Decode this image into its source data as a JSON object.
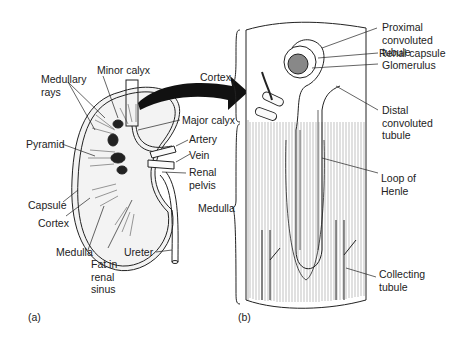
{
  "figure": {
    "panel_a": {
      "tag": "(a)",
      "title": "Kidney longitudinal section",
      "labels": {
        "medullary_rays": [
          "Medullary",
          "rays"
        ],
        "minor_calyx": "Minor calyx",
        "major_calyx": "Major calyx",
        "pyramid": "Pyramid",
        "artery": "Artery",
        "vein": "Vein",
        "renal_pelvis": [
          "Renal",
          "pelvis"
        ],
        "capsule": "Capsule",
        "cortex": "Cortex",
        "medulla": "Medulla",
        "fat_in_renal_sinus": [
          "Fat in",
          "renal",
          "sinus"
        ],
        "ureter": "Ureter"
      }
    },
    "panel_b": {
      "tag": "(b)",
      "title": "Nephron detail",
      "labels": {
        "cortex": "Cortex",
        "medulla": "Medulla",
        "proximal_convoluted_tubule": [
          "Proximal",
          "convoluted tubule"
        ],
        "renal_capsule": "Renal capsule",
        "glomerulus": "Glomerulus",
        "distal_convoluted_tubule": [
          "Distal",
          "convoluted",
          "tubule"
        ],
        "loop_of_henle": [
          "Loop of",
          "Henle"
        ],
        "collecting_tubule": [
          "Collecting",
          "tubule"
        ]
      }
    },
    "colors": {
      "line": "#222222",
      "fill": "#f2f2f2",
      "arrow": "#111111"
    }
  }
}
